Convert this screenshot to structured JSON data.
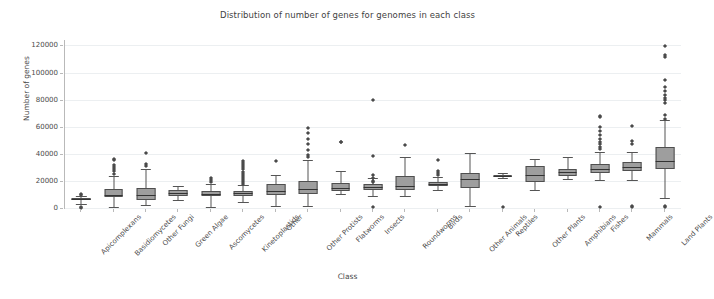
{
  "chart_data": {
    "type": "box",
    "title": "Distribution of number of genes for genomes in each class",
    "xlabel": "Class",
    "ylabel": "Number of genes",
    "ylim": [
      0,
      124000
    ],
    "yticks": [
      0,
      20000,
      40000,
      60000,
      80000,
      100000,
      120000
    ],
    "ytick_labels": [
      "0",
      "20000",
      "40000",
      "60000",
      "80000",
      "100000",
      "120000"
    ],
    "grid": true,
    "legend": "none",
    "categories": [
      "Apicomplexans",
      "Basidiomycetes",
      "Other Fungi",
      "Green Algae",
      "Ascomycetes",
      "Kinetoplastids",
      "Other",
      "Other Protists",
      "Flatworms",
      "Insects",
      "Roundworms",
      "Birds",
      "Other Animals",
      "Reptiles",
      "Other Plants",
      "Amphibians",
      "Fishes",
      "Mammals",
      "Land Plants"
    ],
    "boxes": [
      {
        "category": "Apicomplexans",
        "whisker_low": 3000,
        "q1": 5600,
        "median": 6400,
        "q3": 7600,
        "whisker_high": 9200,
        "fliers": [
          1200,
          2000,
          10500,
          11200
        ]
      },
      {
        "category": "Basidiomycetes",
        "whisker_low": 800,
        "q1": 8200,
        "median": 9800,
        "q3": 14200,
        "whisker_high": 23500,
        "fliers": [
          26000,
          28500,
          30000,
          31500,
          33000,
          36500,
          37500
        ]
      },
      {
        "category": "Other Fungi",
        "whisker_low": 2200,
        "q1": 6000,
        "median": 9800,
        "q3": 14500,
        "whisker_high": 28500,
        "fliers": [
          32000,
          33500,
          42000
        ]
      },
      {
        "category": "Green Algae",
        "whisker_low": 6200,
        "q1": 9200,
        "median": 11000,
        "q3": 13000,
        "whisker_high": 16200,
        "fliers": []
      },
      {
        "category": "Ascomycetes",
        "whisker_low": 1000,
        "q1": 8500,
        "median": 10500,
        "q3": 12600,
        "whisker_high": 18000,
        "fliers": [
          20500,
          21500,
          23000
        ]
      },
      {
        "category": "Kinetoplastids",
        "whisker_low": 4500,
        "q1": 9000,
        "median": 11000,
        "q3": 12500,
        "whisker_high": 17000,
        "fliers": [
          19000,
          20500,
          22000,
          23500,
          25000,
          26500,
          28000,
          30000,
          31500,
          33000,
          34500,
          36000
        ]
      },
      {
        "category": "Other",
        "whisker_low": 1500,
        "q1": 9500,
        "median": 12500,
        "q3": 17500,
        "whisker_high": 24500,
        "fliers": [
          35500
        ]
      },
      {
        "category": "Other Protists",
        "whisker_low": 1300,
        "q1": 10500,
        "median": 14200,
        "q3": 20200,
        "whisker_high": 35500,
        "fliers": [
          38500,
          40500,
          44000,
          48500,
          52000,
          56500,
          60500
        ]
      },
      {
        "category": "Flatworms",
        "whisker_low": 10000,
        "q1": 12800,
        "median": 14800,
        "q3": 18500,
        "whisker_high": 27000,
        "fliers": [
          49500,
          50000
        ]
      },
      {
        "category": "Insects",
        "whisker_low": 9000,
        "q1": 13500,
        "median": 15300,
        "q3": 17800,
        "whisker_high": 22500,
        "fliers": [
          1500,
          20000,
          21000,
          23500,
          25500,
          39500,
          80500
        ]
      },
      {
        "category": "Roundworms",
        "whisker_low": 9000,
        "q1": 13000,
        "median": 16500,
        "q3": 23500,
        "whisker_high": 38000,
        "fliers": [
          47500
        ]
      },
      {
        "category": "Birds",
        "whisker_low": 13000,
        "q1": 16500,
        "median": 18000,
        "q3": 19500,
        "whisker_high": 23000,
        "fliers": [
          25500,
          27000,
          28500,
          36500
        ]
      },
      {
        "category": "Other Animals",
        "whisker_low": 1800,
        "q1": 15000,
        "median": 21500,
        "q3": 26000,
        "whisker_high": 40500,
        "fliers": []
      },
      {
        "category": "Reptiles",
        "whisker_low": 22000,
        "q1": 22800,
        "median": 23500,
        "q3": 24500,
        "whisker_high": 25500,
        "fliers": [
          1500
        ]
      },
      {
        "category": "Other Plants",
        "whisker_low": 13000,
        "q1": 19500,
        "median": 24500,
        "q3": 31000,
        "whisker_high": 36500,
        "fliers": []
      },
      {
        "category": "Amphibians",
        "whisker_low": 21500,
        "q1": 23500,
        "median": 26500,
        "q3": 29000,
        "whisker_high": 37500,
        "fliers": []
      },
      {
        "category": "Fishes",
        "whisker_low": 20500,
        "q1": 25500,
        "median": 28500,
        "q3": 32500,
        "whisker_high": 41500,
        "fliers": [
          1500,
          44500,
          46000,
          48000,
          50000,
          52000,
          55000,
          58000,
          61000,
          68000,
          68800
        ]
      },
      {
        "category": "Mammals",
        "whisker_low": 21000,
        "q1": 27500,
        "median": 30000,
        "q3": 34000,
        "whisker_high": 41500,
        "fliers": [
          1500,
          2500,
          48500,
          50500,
          61500
        ]
      },
      {
        "category": "Land Plants",
        "whisker_low": 7500,
        "q1": 28500,
        "median": 35000,
        "q3": 45000,
        "whisker_high": 65000,
        "fliers": [
          1500,
          2800,
          67000,
          70000,
          78500,
          80500,
          82500,
          84500,
          87500,
          90500,
          95500,
          112500,
          114000,
          121000
        ]
      }
    ]
  },
  "axis": {
    "x_title": "Class",
    "y_title": "Number of genes"
  }
}
